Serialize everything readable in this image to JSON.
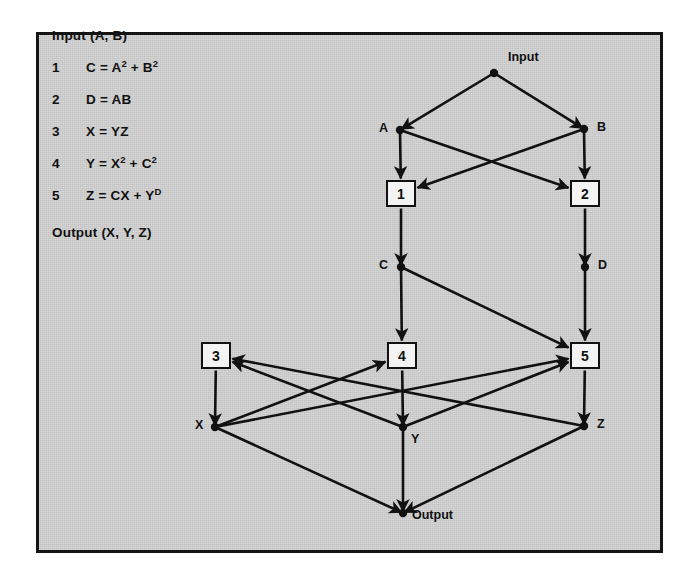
{
  "figure": {
    "background_color": "#cdcdcd",
    "border_color": "#141414",
    "ink_color": "#111111"
  },
  "equations": {
    "header": "Input (A, B)",
    "footer": "Output (X, Y, Z)",
    "rows": [
      {
        "num": "1",
        "lhs": "C",
        "eq": " = ",
        "rhs_pre": "A",
        "sup1": "2",
        "mid": " + B",
        "sup2": "2",
        "rhs_post": ""
      },
      {
        "num": "2",
        "lhs": "D",
        "eq": " = ",
        "rhs_pre": "AB",
        "sup1": "",
        "mid": "",
        "sup2": "",
        "rhs_post": ""
      },
      {
        "num": "3",
        "lhs": "X",
        "eq": " = ",
        "rhs_pre": "YZ",
        "sup1": "",
        "mid": "",
        "sup2": "",
        "rhs_post": ""
      },
      {
        "num": "4",
        "lhs": "Y",
        "eq": " = ",
        "rhs_pre": "X",
        "sup1": "2",
        "mid": " + C",
        "sup2": "2",
        "rhs_post": ""
      },
      {
        "num": "5",
        "lhs": "Z",
        "eq": " = ",
        "rhs_pre": "CX",
        "sup1": "",
        "mid": " + Y",
        "sup2": "D",
        "rhs_post": ""
      }
    ]
  },
  "graph": {
    "operation_boxes": [
      {
        "id": "op1",
        "label": "1",
        "x": 386,
        "y": 180
      },
      {
        "id": "op2",
        "label": "2",
        "x": 570,
        "y": 180
      },
      {
        "id": "op3",
        "label": "3",
        "x": 201,
        "y": 342
      },
      {
        "id": "op4",
        "label": "4",
        "x": 387,
        "y": 342
      },
      {
        "id": "op5",
        "label": "5",
        "x": 570,
        "y": 342
      }
    ],
    "value_nodes": [
      {
        "id": "input",
        "label": "Input",
        "x": 494,
        "y": 73,
        "label_x": 508,
        "label_y": 50
      },
      {
        "id": "A",
        "label": "A",
        "x": 400,
        "y": 130,
        "label_x": 379,
        "label_y": 121
      },
      {
        "id": "B",
        "label": "B",
        "x": 584,
        "y": 129,
        "label_x": 597,
        "label_y": 120
      },
      {
        "id": "C",
        "label": "C",
        "x": 401,
        "y": 267,
        "label_x": 379,
        "label_y": 258
      },
      {
        "id": "D",
        "label": "D",
        "x": 585,
        "y": 267,
        "label_x": 598,
        "label_y": 258
      },
      {
        "id": "X",
        "label": "X",
        "x": 215,
        "y": 427,
        "label_x": 195,
        "label_y": 418
      },
      {
        "id": "Y",
        "label": "Y",
        "x": 403,
        "y": 427,
        "label_x": 411,
        "label_y": 432
      },
      {
        "id": "Z",
        "label": "Z",
        "x": 584,
        "y": 426,
        "label_x": 597,
        "label_y": 417
      },
      {
        "id": "output",
        "label": "Output",
        "x": 403,
        "y": 513,
        "label_x": 412,
        "label_y": 508
      }
    ],
    "edges": [
      {
        "from": "input",
        "to": "A"
      },
      {
        "from": "input",
        "to": "B"
      },
      {
        "from": "A",
        "to": "op1"
      },
      {
        "from": "A",
        "to": "op2"
      },
      {
        "from": "B",
        "to": "op1"
      },
      {
        "from": "B",
        "to": "op2"
      },
      {
        "from": "op1",
        "to": "C"
      },
      {
        "from": "op2",
        "to": "D"
      },
      {
        "from": "C",
        "to": "op4"
      },
      {
        "from": "C",
        "to": "op5"
      },
      {
        "from": "D",
        "to": "op5"
      },
      {
        "from": "op4",
        "to": "Y"
      },
      {
        "from": "op5",
        "to": "Z"
      },
      {
        "from": "op3",
        "to": "X"
      },
      {
        "from": "Y",
        "to": "op3"
      },
      {
        "from": "Z",
        "to": "op3"
      },
      {
        "from": "X",
        "to": "op4"
      },
      {
        "from": "X",
        "to": "op5"
      },
      {
        "from": "Y",
        "to": "op5"
      },
      {
        "from": "X",
        "to": "output"
      },
      {
        "from": "Y",
        "to": "output"
      },
      {
        "from": "Z",
        "to": "output"
      }
    ]
  }
}
